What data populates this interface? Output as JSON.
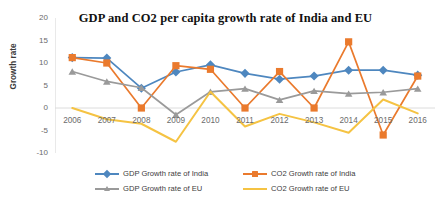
{
  "chart_data": {
    "type": "line",
    "title": "GDP and CO2 per capita growth rate of India and EU",
    "xlabel": "",
    "ylabel": "Growth rate",
    "ylim": [
      -10,
      20
    ],
    "yticks": [
      "20",
      "15",
      "10",
      "5",
      "0",
      "-5",
      "-10"
    ],
    "ytick_values": [
      20,
      15,
      10,
      5,
      0,
      -5,
      -10
    ],
    "grid": false,
    "zero_line": true,
    "legend_position": "bottom",
    "categories": [
      "2006",
      "2007",
      "2008",
      "2009",
      "2010",
      "2011",
      "2012",
      "2013",
      "2014",
      "2015",
      "2016"
    ],
    "series": [
      {
        "name": "GDP Growth rate of India",
        "color": "#4e87bf",
        "marker": "diamond",
        "values": [
          11.2,
          11.1,
          4.4,
          8.0,
          9.6,
          7.7,
          6.4,
          7.1,
          8.4,
          8.4,
          7.3
        ]
      },
      {
        "name": "CO2  Growth rate of India",
        "color": "#ea7a2d",
        "marker": "square",
        "values": [
          11.2,
          10.0,
          0.0,
          9.4,
          8.6,
          0.0,
          8.1,
          0.0,
          14.7,
          -6.0,
          7.1
        ]
      },
      {
        "name": "GDP Growth  rate of EU",
        "color": "#9a9a9a",
        "marker": "triangle",
        "values": [
          8.1,
          5.9,
          4.5,
          -1.5,
          3.6,
          4.3,
          1.8,
          3.8,
          3.2,
          3.5,
          4.3
        ]
      },
      {
        "name": "CO2  Growth  rate of EU",
        "color": "#f5c343",
        "marker": "none",
        "values": [
          0.0,
          -2.5,
          -3.5,
          -7.5,
          3.6,
          -4.1,
          -1.3,
          -3.2,
          -5.5,
          1.9,
          -1.2
        ]
      }
    ]
  },
  "legend": {
    "items": [
      {
        "label": "GDP Growth rate of India"
      },
      {
        "label": "CO2  Growth rate of India"
      },
      {
        "label": "GDP Growth  rate of EU"
      },
      {
        "label": "CO2  Growth  rate of EU"
      }
    ]
  }
}
